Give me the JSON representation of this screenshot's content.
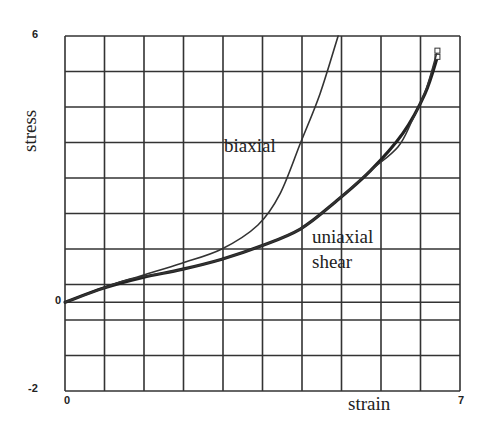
{
  "chart_data": {
    "type": "line",
    "title": "",
    "xlabel": "strain",
    "ylabel": "stress",
    "xlim": [
      0,
      7
    ],
    "ylim": [
      -2,
      6
    ],
    "x_tick_labels": [
      "0",
      "7"
    ],
    "y_tick_labels": [
      "6",
      "0",
      "-2"
    ],
    "grid": true,
    "legend": "inline labels",
    "series": [
      {
        "name": "biaxial",
        "x": [
          0,
          0.69,
          1.38,
          2.07,
          2.78,
          3.42,
          3.81,
          4.18,
          4.52,
          4.84
        ],
        "y": [
          0,
          0.34,
          0.61,
          0.88,
          1.2,
          1.74,
          2.44,
          3.61,
          4.7,
          6.0
        ]
      },
      {
        "name": "uniaxial",
        "x": [
          0,
          0.69,
          1.38,
          2.07,
          2.78,
          3.46,
          4.17,
          4.79,
          5.41,
          5.99,
          6.38,
          6.6
        ],
        "y": [
          0,
          0.32,
          0.56,
          0.74,
          0.97,
          1.26,
          1.65,
          2.26,
          2.96,
          3.81,
          4.7,
          5.53
        ]
      },
      {
        "name": "shear",
        "x": [
          0,
          0.69,
          1.1,
          2.07,
          2.78,
          3.46,
          4.17,
          4.79,
          5.41,
          5.9,
          6.15,
          6.4,
          6.6
        ],
        "y": [
          0,
          0.32,
          0.5,
          0.74,
          0.97,
          1.26,
          1.65,
          2.26,
          2.96,
          3.5,
          4.09,
          4.8,
          5.67
        ]
      }
    ]
  },
  "labels": {
    "ylabel": "stress",
    "xlabel": "strain",
    "ytick_top": "6",
    "ytick_zero": "0",
    "ytick_bottom": "-2",
    "xtick_left": "0",
    "xtick_right": "7",
    "biaxial": "biaxial",
    "uniaxial": "uniaxial",
    "shear": "shear"
  }
}
